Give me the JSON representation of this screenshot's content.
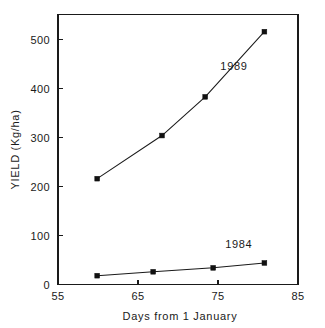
{
  "chart_data": {
    "type": "line",
    "title": "",
    "subtitle": "",
    "xlabel": "Days from 1 January",
    "ylabel": "YIELD (Kg/ha)",
    "xlim": [
      55,
      85
    ],
    "ylim": [
      0,
      550
    ],
    "xticks": [
      55,
      65,
      75,
      85
    ],
    "xtick_labels": [
      "55",
      "65",
      "75",
      "85"
    ],
    "yticks": [
      0,
      100,
      200,
      300,
      400,
      500
    ],
    "ytick_labels": [
      "0",
      "100",
      "200",
      "300",
      "400",
      "500"
    ],
    "grid": false,
    "legend_position": "inline-annotation",
    "marker": "filled-square",
    "line_color": "#1a1a1a",
    "marker_color": "#111111",
    "axis_color": "#1a1a1a",
    "background_color": "#ffffff",
    "series": [
      {
        "name": "1989",
        "label": "1989",
        "annotation": "1989",
        "x": [
          59.9,
          68.0,
          73.4,
          80.8
        ],
        "values": [
          216,
          304,
          383,
          516
        ]
      },
      {
        "name": "1984",
        "label": "1984",
        "annotation": "1984",
        "x": [
          59.9,
          66.9,
          74.4,
          80.8
        ],
        "values": [
          18,
          26,
          34,
          44
        ]
      }
    ],
    "annotations": [
      {
        "text": "1989",
        "x": 77.0,
        "y": 445
      },
      {
        "text": "1984",
        "x": 77.6,
        "y": 82
      }
    ]
  }
}
